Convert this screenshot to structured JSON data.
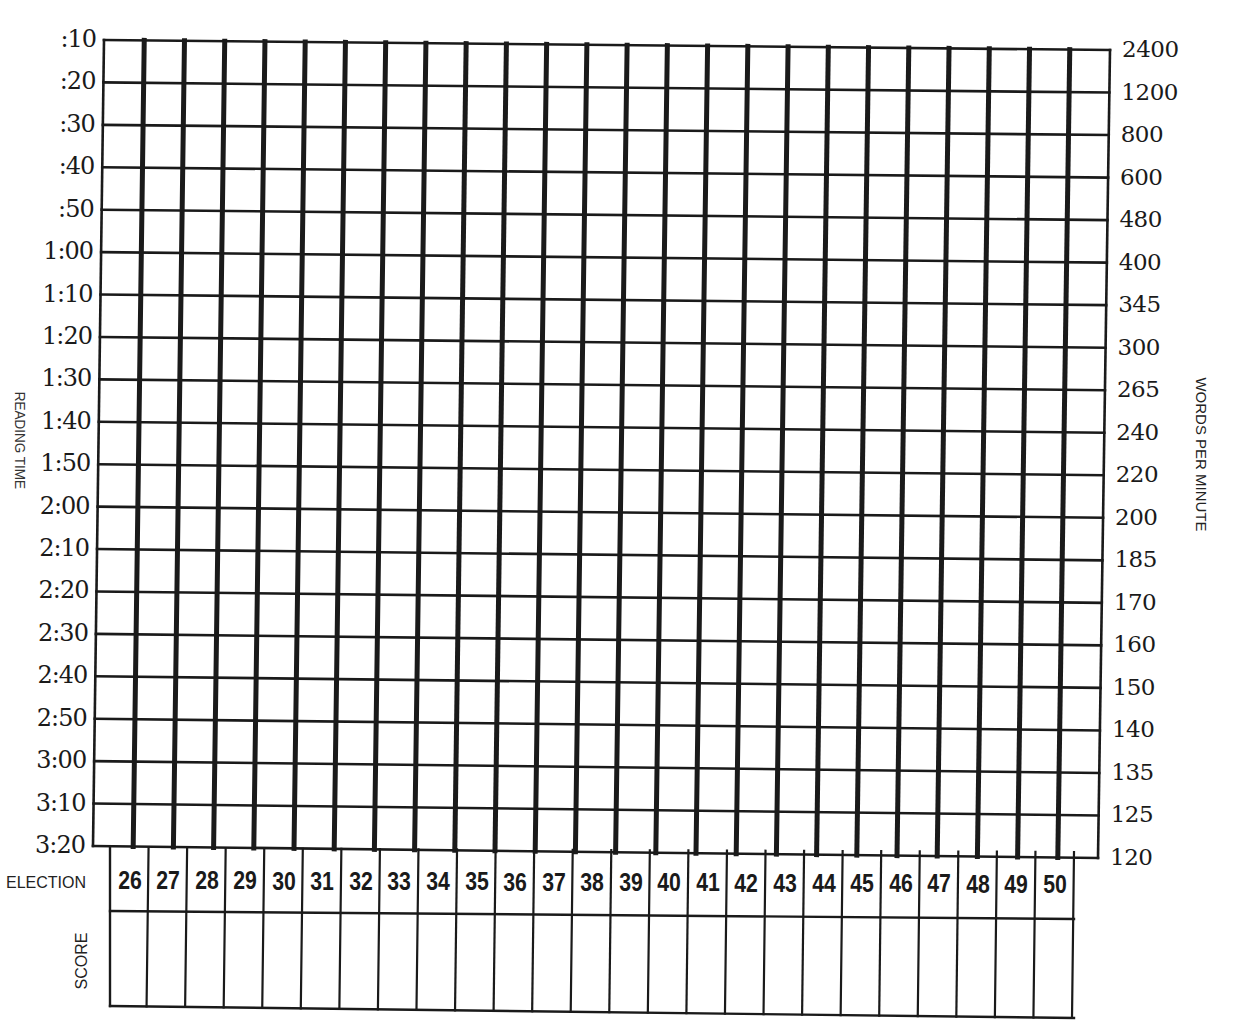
{
  "chart_data": {
    "type": "table",
    "title": "",
    "left_axis": {
      "label": "READING TIME",
      "ticks": [
        ":10",
        ":20",
        ":30",
        ":40",
        ":50",
        "1:00",
        "1:10",
        "1:20",
        "1:30",
        "1:40",
        "1:50",
        "2:00",
        "2:10",
        "2:20",
        "2:30",
        "2:40",
        "2:50",
        "3:00",
        "3:10",
        "3:20"
      ]
    },
    "right_axis": {
      "label": "WORDS PER MINUTE",
      "ticks": [
        "2400",
        "1200",
        "800",
        "600",
        "480",
        "400",
        "345",
        "300",
        "265",
        "240",
        "220",
        "200",
        "185",
        "170",
        "160",
        "150",
        "140",
        "135",
        "125",
        "120"
      ]
    },
    "x_axis": {
      "label": "SELECTION",
      "categories": [
        "26",
        "27",
        "28",
        "29",
        "30",
        "31",
        "32",
        "33",
        "34",
        "35",
        "36",
        "37",
        "38",
        "39",
        "40",
        "41",
        "42",
        "43",
        "44",
        "45",
        "46",
        "47",
        "48",
        "49",
        "50"
      ]
    },
    "score_row_label": "SCORE",
    "scores": [
      "",
      "",
      "",
      "",
      "",
      "",
      "",
      "",
      "",
      "",
      "",
      "",
      "",
      "",
      "",
      "",
      "",
      "",
      "",
      "",
      "",
      "",
      "",
      "",
      ""
    ],
    "grid": {
      "columns": 25,
      "rows": 19,
      "on": true
    },
    "series": []
  },
  "labels": {
    "reading_time": "READING TIME",
    "words_per_minute": "WORDS PER MINUTE",
    "selection": "ELECTION",
    "score": "SCORE"
  },
  "colors": {
    "ink": "#1a1a1a",
    "paper": "#ffffff"
  }
}
